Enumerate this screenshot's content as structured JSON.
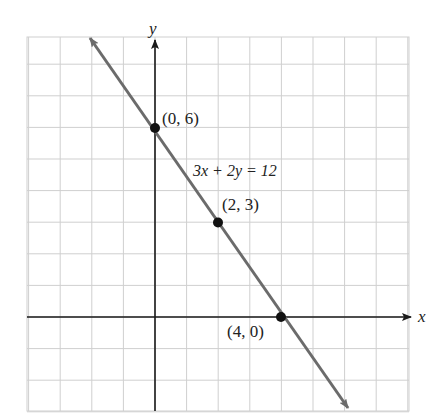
{
  "chart_data": {
    "type": "line",
    "title": "",
    "xlabel": "x",
    "ylabel": "y",
    "equation": "3x + 2y = 12",
    "xlim": [
      -4,
      8
    ],
    "ylim": [
      -3,
      9
    ],
    "grid": true,
    "grid_step": 1,
    "series": [
      {
        "name": "3x + 2y = 12",
        "x": [
          -2,
          6.2
        ],
        "y": [
          9,
          -3.3
        ],
        "color": "#6b6b6b"
      }
    ],
    "points": [
      {
        "x": 0,
        "y": 6,
        "label": "(0, 6)"
      },
      {
        "x": 2,
        "y": 3,
        "label": "(2, 3)"
      },
      {
        "x": 4,
        "y": 0,
        "label": "(4, 0)"
      }
    ]
  },
  "labels": {
    "x_axis": "x",
    "y_axis": "y",
    "equation": "3x + 2y = 12",
    "p0": "(0, 6)",
    "p1": "(2, 3)",
    "p2": "(4, 0)"
  },
  "colors": {
    "grid": "#c8c8c8",
    "axis": "#1a1a1a",
    "line": "#6b6b6b",
    "point": "#111111"
  }
}
